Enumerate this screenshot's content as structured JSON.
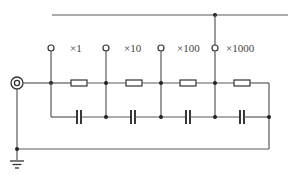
{
  "diagram": {
    "type": "circuit-schematic",
    "colors": {
      "wire": "#5a5a5a",
      "background": "#ffffff"
    },
    "taps": [
      {
        "label": "×1",
        "x": 51
      },
      {
        "label": "×10",
        "x": 106
      },
      {
        "label": "×100",
        "x": 161
      },
      {
        "label": "×1000",
        "x": 215
      }
    ],
    "resistors": [
      79,
      134,
      188,
      242
    ],
    "capacitors": [
      79,
      134,
      188,
      242
    ],
    "input": "coaxial-connector",
    "ground": "ground-symbol"
  }
}
